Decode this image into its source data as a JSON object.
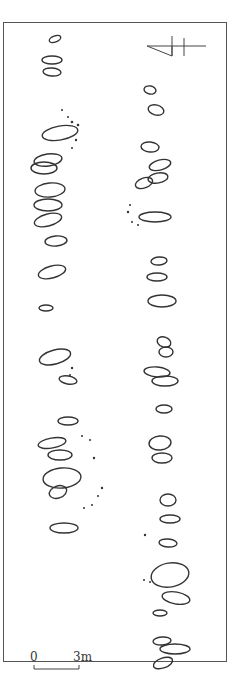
{
  "figure": {
    "type": "archaeological site plan",
    "north_arrow": {
      "icon": "north-arrow-icon"
    },
    "scale_bar": {
      "start_label": "0",
      "end_label": "3m"
    },
    "caption": ""
  },
  "features": {
    "west_row": [
      {
        "cx": 55,
        "cy": 39,
        "rx": 6,
        "ry": 3,
        "rot": -20
      },
      {
        "cx": 52,
        "cy": 60,
        "rx": 10,
        "ry": 4,
        "rot": 0
      },
      {
        "cx": 52,
        "cy": 72,
        "rx": 9,
        "ry": 4,
        "rot": 5
      },
      {
        "cx": 60,
        "cy": 133,
        "rx": 18,
        "ry": 7,
        "rot": -10
      },
      {
        "cx": 48,
        "cy": 160,
        "rx": 14,
        "ry": 6,
        "rot": -8
      },
      {
        "cx": 44,
        "cy": 168,
        "rx": 13,
        "ry": 6,
        "rot": 0
      },
      {
        "cx": 50,
        "cy": 190,
        "rx": 15,
        "ry": 7,
        "rot": -5
      },
      {
        "cx": 48,
        "cy": 205,
        "rx": 14,
        "ry": 6,
        "rot": 0
      },
      {
        "cx": 48,
        "cy": 220,
        "rx": 14,
        "ry": 6,
        "rot": -15
      },
      {
        "cx": 56,
        "cy": 241,
        "rx": 11,
        "ry": 5,
        "rot": -5
      },
      {
        "cx": 52,
        "cy": 272,
        "rx": 14,
        "ry": 6,
        "rot": -15
      },
      {
        "cx": 46,
        "cy": 308,
        "rx": 7,
        "ry": 3,
        "rot": 0
      },
      {
        "cx": 55,
        "cy": 357,
        "rx": 16,
        "ry": 7,
        "rot": -15
      },
      {
        "cx": 68,
        "cy": 380,
        "rx": 9,
        "ry": 4,
        "rot": 10
      },
      {
        "cx": 68,
        "cy": 421,
        "rx": 10,
        "ry": 4,
        "rot": 0
      },
      {
        "cx": 52,
        "cy": 443,
        "rx": 14,
        "ry": 5,
        "rot": -10
      },
      {
        "cx": 60,
        "cy": 455,
        "rx": 12,
        "ry": 5,
        "rot": 0
      },
      {
        "cx": 62,
        "cy": 478,
        "rx": 19,
        "ry": 10,
        "rot": -5
      },
      {
        "cx": 58,
        "cy": 492,
        "rx": 9,
        "ry": 6,
        "rot": -20
      },
      {
        "cx": 64,
        "cy": 528,
        "rx": 14,
        "ry": 5,
        "rot": 0
      }
    ],
    "east_row": [
      {
        "cx": 150,
        "cy": 90,
        "rx": 6,
        "ry": 4,
        "rot": 10
      },
      {
        "cx": 156,
        "cy": 110,
        "rx": 8,
        "ry": 5,
        "rot": 15
      },
      {
        "cx": 150,
        "cy": 147,
        "rx": 9,
        "ry": 5,
        "rot": 5
      },
      {
        "cx": 160,
        "cy": 165,
        "rx": 11,
        "ry": 5,
        "rot": -15
      },
      {
        "cx": 144,
        "cy": 183,
        "rx": 9,
        "ry": 5,
        "rot": -20
      },
      {
        "cx": 158,
        "cy": 178,
        "rx": 10,
        "ry": 5,
        "rot": -10
      },
      {
        "cx": 155,
        "cy": 217,
        "rx": 16,
        "ry": 5,
        "rot": 0
      },
      {
        "cx": 159,
        "cy": 261,
        "rx": 8,
        "ry": 4,
        "rot": -5
      },
      {
        "cx": 157,
        "cy": 277,
        "rx": 10,
        "ry": 4,
        "rot": 0
      },
      {
        "cx": 162,
        "cy": 301,
        "rx": 14,
        "ry": 6,
        "rot": 0
      },
      {
        "cx": 164,
        "cy": 342,
        "rx": 7,
        "ry": 5,
        "rot": 20
      },
      {
        "cx": 166,
        "cy": 352,
        "rx": 7,
        "ry": 5,
        "rot": 0
      },
      {
        "cx": 157,
        "cy": 372,
        "rx": 13,
        "ry": 5,
        "rot": 5
      },
      {
        "cx": 165,
        "cy": 381,
        "rx": 13,
        "ry": 5,
        "rot": 0
      },
      {
        "cx": 164,
        "cy": 409,
        "rx": 8,
        "ry": 4,
        "rot": 0
      },
      {
        "cx": 160,
        "cy": 443,
        "rx": 11,
        "ry": 7,
        "rot": -5
      },
      {
        "cx": 162,
        "cy": 458,
        "rx": 10,
        "ry": 5,
        "rot": 0
      },
      {
        "cx": 168,
        "cy": 500,
        "rx": 8,
        "ry": 6,
        "rot": 0
      },
      {
        "cx": 170,
        "cy": 519,
        "rx": 10,
        "ry": 4,
        "rot": 0
      },
      {
        "cx": 168,
        "cy": 543,
        "rx": 9,
        "ry": 4,
        "rot": 5
      },
      {
        "cx": 170,
        "cy": 575,
        "rx": 19,
        "ry": 12,
        "rot": -10
      },
      {
        "cx": 176,
        "cy": 598,
        "rx": 14,
        "ry": 6,
        "rot": 10
      },
      {
        "cx": 160,
        "cy": 613,
        "rx": 7,
        "ry": 3,
        "rot": 0
      },
      {
        "cx": 162,
        "cy": 641,
        "rx": 9,
        "ry": 4,
        "rot": -5
      },
      {
        "cx": 175,
        "cy": 649,
        "rx": 15,
        "ry": 5,
        "rot": 0
      },
      {
        "cx": 163,
        "cy": 663,
        "rx": 10,
        "ry": 5,
        "rot": -20
      }
    ]
  }
}
